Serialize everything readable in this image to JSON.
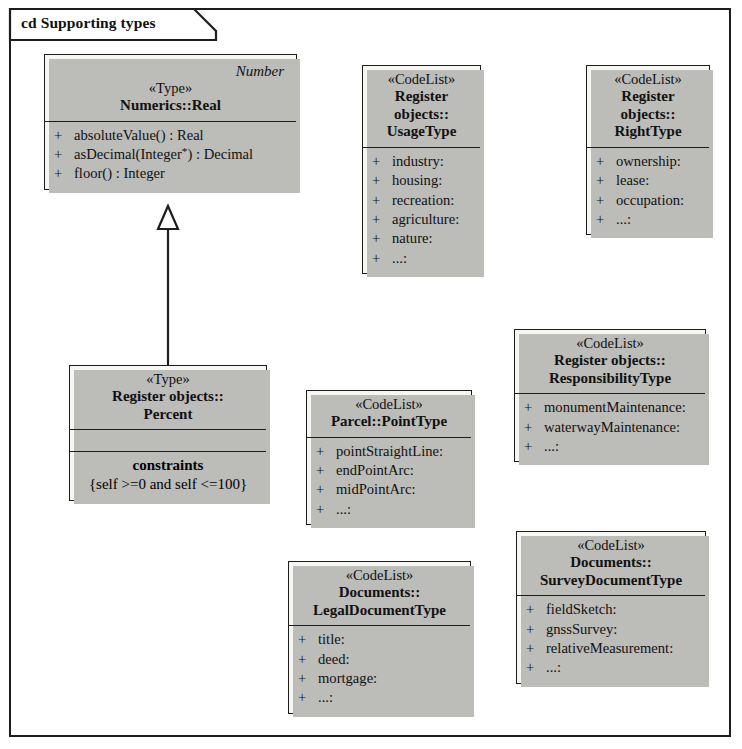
{
  "frame": {
    "title": "cd Supporting types"
  },
  "classes": {
    "real": {
      "role_label": "Number",
      "stereotype": "«Type»",
      "name": "Numerics::Real",
      "operations": [
        {
          "visibility": "+",
          "signature": "absoluteValue() : Real"
        },
        {
          "visibility": "+",
          "signature": "asDecimal(Integer*) : Decimal"
        },
        {
          "visibility": "+",
          "signature": "floor() : Integer"
        }
      ]
    },
    "percent": {
      "stereotype": "«Type»",
      "name_line1": "Register objects::",
      "name_line2": "Percent",
      "constraints_title": "constraints",
      "constraints_expr": "{self >=0 and self <=100}"
    },
    "usage_type": {
      "stereotype": "«CodeList»",
      "name_line1": "Register",
      "name_line2": "objects::",
      "name_line3": "UsageType",
      "literals": [
        {
          "visibility": "+",
          "signature": "industry:"
        },
        {
          "visibility": "+",
          "signature": "housing:"
        },
        {
          "visibility": "+",
          "signature": "recreation:"
        },
        {
          "visibility": "+",
          "signature": "agriculture:"
        },
        {
          "visibility": "+",
          "signature": "nature:"
        },
        {
          "visibility": "+",
          "signature": "...:"
        }
      ]
    },
    "right_type": {
      "stereotype": "«CodeList»",
      "name_line1": "Register",
      "name_line2": "objects::",
      "name_line3": "RightType",
      "literals": [
        {
          "visibility": "+",
          "signature": "ownership:"
        },
        {
          "visibility": "+",
          "signature": "lease:"
        },
        {
          "visibility": "+",
          "signature": "occupation:"
        },
        {
          "visibility": "+",
          "signature": "...:"
        }
      ]
    },
    "responsibility_type": {
      "stereotype": "«CodeList»",
      "name_line1": "Register objects::",
      "name_line2": "ResponsibilityType",
      "literals": [
        {
          "visibility": "+",
          "signature": "monumentMaintenance:"
        },
        {
          "visibility": "+",
          "signature": "waterwayMaintenance:"
        },
        {
          "visibility": "+",
          "signature": "...:"
        }
      ]
    },
    "point_type": {
      "stereotype": "«CodeList»",
      "name": "Parcel::PointType",
      "literals": [
        {
          "visibility": "+",
          "signature": "pointStraightLine:"
        },
        {
          "visibility": "+",
          "signature": "endPointArc:"
        },
        {
          "visibility": "+",
          "signature": "midPointArc:"
        },
        {
          "visibility": "+",
          "signature": "...:"
        }
      ]
    },
    "legal_document_type": {
      "stereotype": "«CodeList»",
      "name_line1": "Documents::",
      "name_line2": "LegalDocumentType",
      "literals": [
        {
          "visibility": "+",
          "signature": "title:"
        },
        {
          "visibility": "+",
          "signature": "deed:"
        },
        {
          "visibility": "+",
          "signature": "mortgage:"
        },
        {
          "visibility": "+",
          "signature": "...:"
        }
      ]
    },
    "survey_document_type": {
      "stereotype": "«CodeList»",
      "name_line1": "Documents::",
      "name_line2": "SurveyDocumentType",
      "literals": [
        {
          "visibility": "+",
          "signature": "fieldSketch:"
        },
        {
          "visibility": "+",
          "signature": "gnssSurvey:"
        },
        {
          "visibility": "+",
          "signature": "relativeMeasurement:"
        },
        {
          "visibility": "+",
          "signature": "...:"
        }
      ]
    }
  },
  "relationships": [
    {
      "type": "generalization",
      "from": "Register objects::Percent",
      "to": "Numerics::Real"
    }
  ],
  "colors": {
    "box_fill": "#f6f6f3",
    "line": "#1d1d1d",
    "shadow": "#bcbcb8",
    "page": "#ffffff"
  }
}
